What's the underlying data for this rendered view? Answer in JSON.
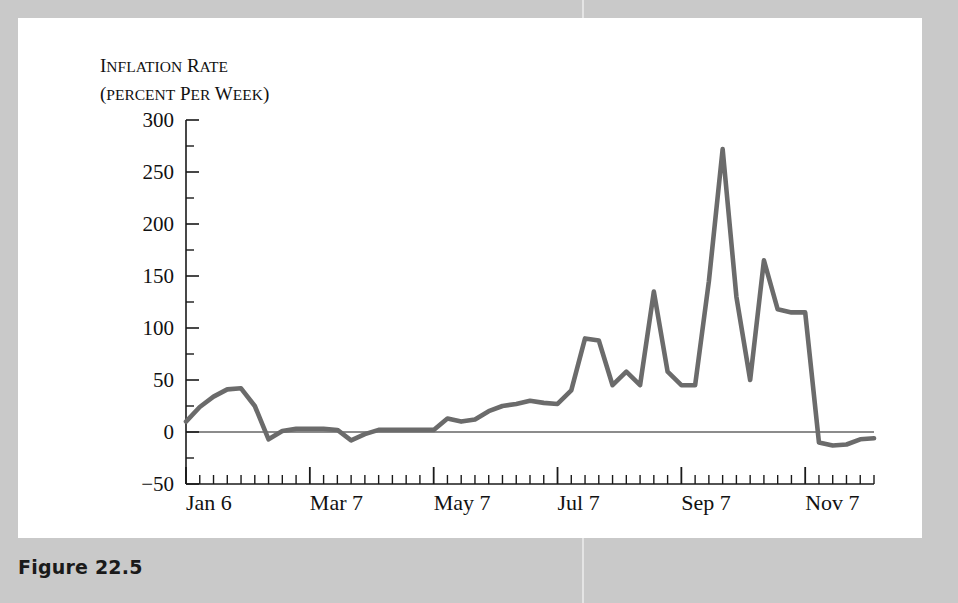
{
  "caption": "Figure 22.5",
  "colors": {
    "page_margin": "#c9c9c9",
    "panel": "#ffffff",
    "line": "#6b6b6b",
    "axis": "#1a1a1a",
    "caption_text": "#1a1a1a"
  },
  "chart_data": {
    "type": "line",
    "title": "",
    "ylabel_line1": "Inflation rate",
    "ylabel_line2": "(percent per week)",
    "xlabel": "",
    "ylim": [
      -50,
      300
    ],
    "yticks": [
      -50,
      0,
      50,
      100,
      150,
      200,
      250,
      300
    ],
    "ytick_labels": [
      "−50",
      "0",
      "50",
      "100",
      "150",
      "200",
      "250",
      "300"
    ],
    "yminor_step": 25,
    "grid": false,
    "zero_line": true,
    "legend": "none",
    "xtick_labels": [
      "Jan 6",
      "Mar 7",
      "May 7",
      "Jul 7",
      "Sep 7",
      "Nov 7"
    ],
    "xtick_indices": [
      0,
      9,
      18,
      27,
      36,
      45
    ],
    "x_minor_step_weeks": 1,
    "x_count": 51,
    "series": [
      {
        "name": "Inflation rate (percent per week)",
        "values": [
          10,
          24,
          34,
          41,
          42,
          25,
          -7,
          1,
          3,
          3,
          3,
          2,
          -8,
          -2,
          2,
          2,
          2,
          2,
          2,
          13,
          10,
          12,
          20,
          25,
          27,
          30,
          28,
          27,
          40,
          90,
          88,
          45,
          58,
          45,
          135,
          58,
          45,
          45,
          145,
          272,
          130,
          50,
          165,
          118,
          115,
          115,
          -10,
          -13,
          -12,
          -7,
          -6
        ]
      }
    ]
  }
}
